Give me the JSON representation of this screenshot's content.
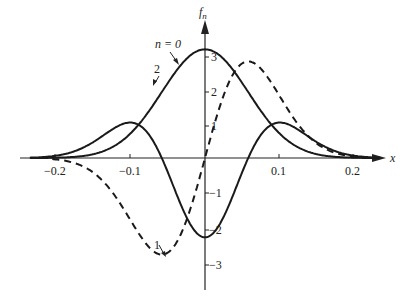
{
  "chart_data": {
    "type": "line",
    "title": "",
    "xlabel": "x",
    "ylabel": "f_n",
    "xlim": [
      -0.24,
      0.24
    ],
    "ylim": [
      -3.3,
      3.5
    ],
    "grid": false,
    "legend": "inline annotations",
    "x_ticks": [
      -0.2,
      -0.1,
      0.1,
      0.2
    ],
    "x_tick_labels": [
      "−0.2",
      "−0.1",
      "0.1",
      "0.2"
    ],
    "y_ticks": [
      3,
      2,
      1,
      -1,
      -2,
      -3
    ],
    "y_tick_labels": [
      "3",
      "2",
      "1",
      "−1",
      "−2",
      "−3"
    ],
    "series": [
      {
        "name": "n = 0",
        "style": "solid",
        "x": [
          -0.22,
          -0.2,
          -0.15,
          -0.1,
          -0.05,
          0,
          0.05,
          0.1,
          0.15,
          0.2,
          0.22
        ],
        "values": [
          0.0,
          0.07,
          0.3,
          0.9,
          2.2,
          3.15,
          2.2,
          0.9,
          0.3,
          0.07,
          0.0
        ]
      },
      {
        "name": "1",
        "style": "dashed",
        "x": [
          -0.2,
          -0.15,
          -0.1,
          -0.058,
          0,
          0.058,
          0.1,
          0.15,
          0.2
        ],
        "values": [
          0.0,
          -0.6,
          -1.8,
          -2.8,
          0.0,
          2.8,
          1.8,
          0.6,
          0.0
        ]
      },
      {
        "name": "2",
        "style": "solid",
        "x": [
          -0.22,
          -0.2,
          -0.15,
          -0.09,
          -0.05,
          0,
          0.05,
          0.09,
          0.15,
          0.2,
          0.22
        ],
        "values": [
          0.0,
          0.15,
          1.2,
          2.6,
          1.0,
          -2.3,
          1.0,
          2.6,
          1.2,
          0.15,
          0.0
        ]
      }
    ],
    "annotations": [
      {
        "text": "n = 0",
        "points_to": "n = 0 curve, left flank near x≈-0.03"
      },
      {
        "text": "2",
        "points_to": "n = 2 curve, right of left peak near x≈-0.065"
      },
      {
        "text": "1",
        "points_to": "n = 1 dashed curve minimum near x≈-0.055"
      }
    ]
  },
  "labels": {
    "y_axis": "f",
    "y_axis_sub": "n",
    "x_axis": "x",
    "ann_n0": "n = 0",
    "ann_2": "2",
    "ann_1": "1",
    "ticks_x": [
      "−0.2",
      "−0.1",
      "0.1",
      "0.2"
    ],
    "ticks_y": [
      "3",
      "2",
      "1",
      "−1",
      "−2",
      "−3"
    ]
  },
  "model": {
    "sigma": 0.058,
    "a0": 3.15,
    "a1": 2.8,
    "a2_min": -2.3
  }
}
